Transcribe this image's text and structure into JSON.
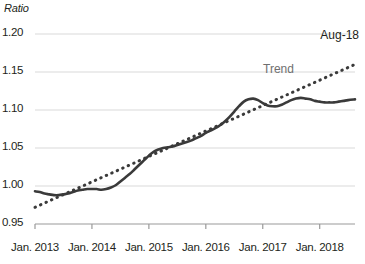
{
  "chart_data": {
    "type": "line",
    "title": "",
    "xlabel": "",
    "ylabel": "Ratio",
    "ylim": [
      0.95,
      1.2
    ],
    "ytick_values": [
      0.95,
      1.0,
      1.05,
      1.1,
      1.15,
      1.2
    ],
    "ytick_labels": [
      "0.95",
      "1.00",
      "1.05",
      "1.10",
      "1.15",
      "1.20"
    ],
    "xtick_labels": [
      "Jan. 2013",
      "Jan. 2014",
      "Jan. 2015",
      "Jan. 2016",
      "Jan. 2017",
      "Jan. 2018"
    ],
    "xtick_positions": [
      2013.0,
      2014.0,
      2015.0,
      2016.0,
      2017.0,
      2018.0
    ],
    "xlim": [
      2013.0,
      2018.62
    ],
    "grid": "horizontal",
    "legend": "none",
    "annotations": [
      {
        "text": "Aug-18",
        "color": "#231f20"
      },
      {
        "text": "Trend",
        "color": "#6f6f6f"
      }
    ],
    "series": [
      {
        "name": "Ratio",
        "style": "solid",
        "color": "#3a3a3a",
        "x": [
          2013.0,
          2013.083,
          2013.167,
          2013.25,
          2013.333,
          2013.417,
          2013.5,
          2013.583,
          2013.667,
          2013.75,
          2013.833,
          2013.917,
          2014.0,
          2014.083,
          2014.167,
          2014.25,
          2014.333,
          2014.417,
          2014.5,
          2014.583,
          2014.667,
          2014.75,
          2014.833,
          2014.917,
          2015.0,
          2015.083,
          2015.167,
          2015.25,
          2015.333,
          2015.417,
          2015.5,
          2015.583,
          2015.667,
          2015.75,
          2015.833,
          2015.917,
          2016.0,
          2016.083,
          2016.167,
          2016.25,
          2016.333,
          2016.417,
          2016.5,
          2016.583,
          2016.667,
          2016.75,
          2016.833,
          2016.917,
          2017.0,
          2017.083,
          2017.167,
          2017.25,
          2017.333,
          2017.417,
          2017.5,
          2017.583,
          2017.667,
          2017.75,
          2017.833,
          2017.917,
          2018.0,
          2018.083,
          2018.167,
          2018.25,
          2018.333,
          2018.417,
          2018.5,
          2018.62
        ],
        "values": [
          0.993,
          0.992,
          0.99,
          0.989,
          0.988,
          0.988,
          0.989,
          0.99,
          0.992,
          0.994,
          0.995,
          0.996,
          0.996,
          0.996,
          0.995,
          0.996,
          0.998,
          1.001,
          1.006,
          1.011,
          1.016,
          1.022,
          1.028,
          1.034,
          1.04,
          1.045,
          1.048,
          1.05,
          1.051,
          1.052,
          1.054,
          1.056,
          1.058,
          1.06,
          1.063,
          1.066,
          1.07,
          1.073,
          1.076,
          1.08,
          1.085,
          1.091,
          1.098,
          1.105,
          1.111,
          1.114,
          1.115,
          1.113,
          1.109,
          1.106,
          1.105,
          1.105,
          1.107,
          1.11,
          1.113,
          1.115,
          1.116,
          1.115,
          1.114,
          1.112,
          1.111,
          1.11,
          1.11,
          1.11,
          1.111,
          1.112,
          1.113,
          1.114
        ]
      },
      {
        "name": "Trend",
        "style": "dotted",
        "color": "#3a3a3a",
        "x": [
          2013.0,
          2018.62
        ],
        "values": [
          0.972,
          1.16
        ]
      }
    ]
  },
  "labels": {
    "axis_title": "Ratio",
    "aug18": "Aug-18",
    "trend": "Trend"
  }
}
